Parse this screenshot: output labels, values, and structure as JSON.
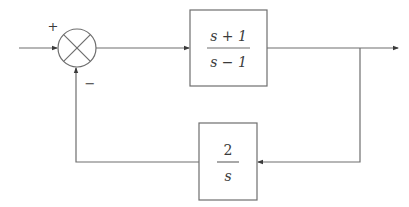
{
  "diagram": {
    "type": "feedback-control-block-diagram",
    "summing_junction": {
      "symbol": "⊗",
      "plus_sign": "+",
      "minus_sign": "−"
    },
    "forward_block": {
      "numerator": "s + 1",
      "denominator": "s − 1"
    },
    "feedback_block": {
      "numerator": "2",
      "denominator": "s"
    },
    "colors": {
      "line": "#6e6e6e",
      "text": "#3a3a3a",
      "background": "#ffffff"
    }
  }
}
